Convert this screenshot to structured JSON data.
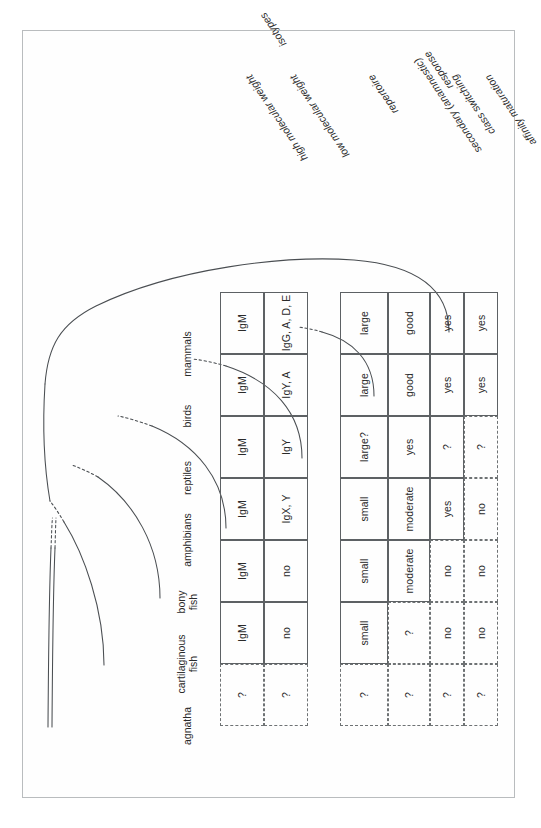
{
  "figure": {
    "kind": "phylogeny-table",
    "species": [
      {
        "id": "agnatha",
        "label": "agnatha",
        "lines": [
          "agnatha"
        ]
      },
      {
        "id": "cartilaginous-fish",
        "label": "cartilaginous fish",
        "lines": [
          "cartilaginous",
          "fish"
        ]
      },
      {
        "id": "bony-fish",
        "label": "bony fish",
        "lines": [
          "bony",
          "fish"
        ]
      },
      {
        "id": "amphibians",
        "label": "amphibians",
        "lines": [
          "amphibians"
        ]
      },
      {
        "id": "reptiles",
        "label": "reptiles",
        "lines": [
          "reptiles"
        ]
      },
      {
        "id": "birds",
        "label": "birds",
        "lines": [
          "birds"
        ]
      },
      {
        "id": "mammals",
        "label": "mammals",
        "lines": [
          "mammals"
        ]
      }
    ],
    "upper_table": {
      "row_labels": [
        {
          "id": "affinity-maturation",
          "lines": [
            "affinity maturation"
          ]
        },
        {
          "id": "class-switching",
          "lines": [
            "class switching"
          ]
        },
        {
          "id": "secondary-response",
          "lines": [
            "secondary (anamnestic)",
            "response"
          ]
        },
        {
          "id": "repertoire",
          "lines": [
            "repertoire"
          ]
        }
      ],
      "rows": [
        {
          "id": "affinity-maturation",
          "cells": [
            {
              "species": "agnatha",
              "text": "?",
              "border": "dashed"
            },
            {
              "species": "cartilaginous-fish",
              "text": "no",
              "border": "dashed"
            },
            {
              "species": "bony-fish",
              "text": "no",
              "border": "dashed"
            },
            {
              "species": "amphibians",
              "text": "no",
              "border": "dashed"
            },
            {
              "species": "reptiles",
              "text": "?",
              "border": "dashed"
            },
            {
              "species": "birds",
              "text": "yes",
              "border": "solid"
            },
            {
              "species": "mammals",
              "text": "yes",
              "border": "solid"
            }
          ]
        },
        {
          "id": "class-switching",
          "cells": [
            {
              "species": "agnatha",
              "text": "?",
              "border": "dashed"
            },
            {
              "species": "cartilaginous-fish",
              "text": "no",
              "border": "dashed"
            },
            {
              "species": "bony-fish",
              "text": "no",
              "border": "dashed"
            },
            {
              "species": "amphibians",
              "text": "yes",
              "border": "solid"
            },
            {
              "species": "reptiles",
              "text": "?",
              "border": "solid"
            },
            {
              "species": "birds",
              "text": "yes",
              "border": "solid"
            },
            {
              "species": "mammals",
              "text": "yes",
              "border": "solid"
            }
          ]
        },
        {
          "id": "secondary-response",
          "cells": [
            {
              "species": "agnatha",
              "text": "?",
              "border": "dashed"
            },
            {
              "species": "cartilaginous-fish",
              "text": "?",
              "border": "dashed"
            },
            {
              "species": "bony-fish",
              "text": "moderate",
              "border": "solid"
            },
            {
              "species": "amphibians",
              "text": "moderate",
              "border": "solid"
            },
            {
              "species": "reptiles",
              "text": "yes",
              "border": "solid"
            },
            {
              "species": "birds",
              "text": "good",
              "border": "solid"
            },
            {
              "species": "mammals",
              "text": "good",
              "border": "solid"
            }
          ]
        },
        {
          "id": "repertoire",
          "cells": [
            {
              "species": "agnatha",
              "text": "?",
              "border": "dashed"
            },
            {
              "species": "cartilaginous-fish",
              "text": "small",
              "border": "solid"
            },
            {
              "species": "bony-fish",
              "text": "small",
              "border": "solid"
            },
            {
              "species": "amphibians",
              "text": "small",
              "border": "solid"
            },
            {
              "species": "reptiles",
              "text": "large?",
              "border": "solid"
            },
            {
              "species": "birds",
              "text": "large",
              "border": "solid"
            },
            {
              "species": "mammals",
              "text": "large",
              "border": "solid"
            }
          ]
        }
      ]
    },
    "lower_table": {
      "group_label": "isotypes",
      "row_labels": [
        {
          "id": "low-molecular-weight",
          "lines": [
            "low molecular weight"
          ]
        },
        {
          "id": "high-molecular-weight",
          "lines": [
            "high molecular weight"
          ]
        }
      ],
      "rows": [
        {
          "id": "low-molecular-weight",
          "cells": [
            {
              "species": "agnatha",
              "text": "?",
              "border": "dashed"
            },
            {
              "species": "cartilaginous-fish",
              "text": "no",
              "border": "solid"
            },
            {
              "species": "bony-fish",
              "text": "no",
              "border": "solid"
            },
            {
              "species": "amphibians",
              "text": "IgX, Y",
              "border": "solid"
            },
            {
              "species": "reptiles",
              "text": "IgY",
              "border": "solid"
            },
            {
              "species": "birds",
              "text": "IgY, A",
              "border": "solid"
            },
            {
              "species": "mammals",
              "text": "IgG, A, D, E",
              "border": "solid"
            }
          ]
        },
        {
          "id": "high-molecular-weight",
          "cells": [
            {
              "species": "agnatha",
              "text": "?",
              "border": "dashed"
            },
            {
              "species": "cartilaginous-fish",
              "text": "IgM",
              "border": "solid"
            },
            {
              "species": "bony-fish",
              "text": "IgM",
              "border": "solid"
            },
            {
              "species": "amphibians",
              "text": "IgM",
              "border": "solid"
            },
            {
              "species": "reptiles",
              "text": "IgM",
              "border": "solid"
            },
            {
              "species": "birds",
              "text": "IgM",
              "border": "solid"
            },
            {
              "species": "mammals",
              "text": "IgM",
              "border": "solid"
            }
          ]
        }
      ]
    },
    "colors": {
      "cell_border_solid": "#5d6164",
      "cell_border_dashed": "#6e7274",
      "text": "#2a2a2a",
      "tree_line": "#4a4e52",
      "page_frame": "#b9bcbe",
      "background": "#ffffff"
    }
  }
}
